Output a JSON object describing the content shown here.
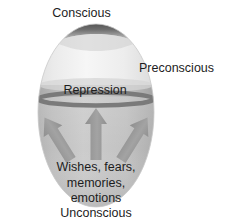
{
  "diagram": {
    "title_role": "freudian-psyche-egg-diagram",
    "labels": {
      "conscious": "Conscious",
      "preconscious": "Preconscious",
      "repression": "Repression",
      "unconscious": "Unconscious",
      "drives_line1": "Wishes, fears,",
      "drives_line2": "memories,",
      "drives_line3": "emotions"
    },
    "colors": {
      "background": "#ffffff",
      "text": "#1d1d1d",
      "egg_upper_light": "#f2f2f2",
      "egg_upper_mid": "#e2e2e2",
      "egg_lower_light": "#d0d0d0",
      "egg_lower_mid": "#b6b6b6",
      "conscious_cap_dark": "#5f5f5f",
      "conscious_cap_light": "#d8d8d8",
      "repression_band": "#b9b9b9",
      "repression_line": "#7c7c7c",
      "arrow_fill": "#9d9d9d",
      "arrow_fill_light": "#ababab"
    },
    "shapes": {
      "egg_center_x": 96,
      "egg_top_y": 24,
      "egg_bottom_y": 207,
      "egg_half_width": 58,
      "repression_band_top_y": 85,
      "repression_band_bottom_y": 101,
      "arrow_count": 3
    }
  }
}
